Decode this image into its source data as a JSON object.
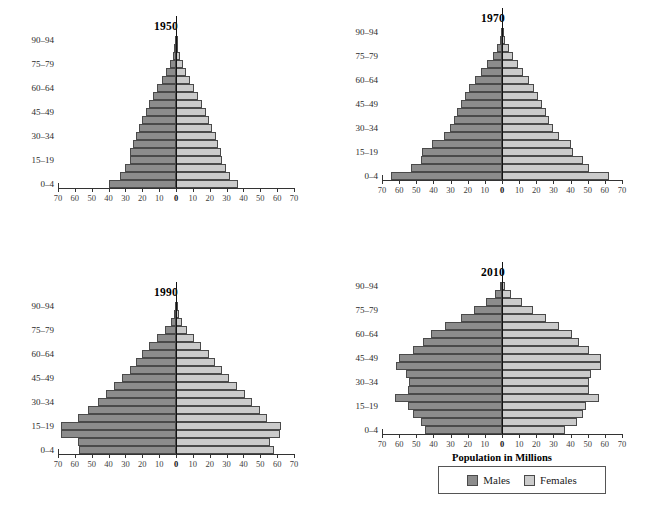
{
  "figure": {
    "axis_title": "Population in Millions",
    "legend": {
      "males_label": "Males",
      "females_label": "Females"
    },
    "colors": {
      "males": "#8c8c8c",
      "females": "#cbcbcb",
      "axis": "#333333"
    }
  },
  "chart_data": [
    {
      "type": "bar",
      "title": "1950",
      "xlabel": "Population in Millions",
      "ylabel": "",
      "xlim": [
        -70,
        70
      ],
      "xticks": [
        70,
        60,
        50,
        40,
        30,
        20,
        10,
        0,
        10,
        20,
        30,
        40,
        50,
        60,
        70
      ],
      "grid": false,
      "legend_position": "below-2010",
      "categories": [
        "0–4",
        "5–9",
        "10–14",
        "15–19",
        "20–24",
        "25–29",
        "30–34",
        "35–39",
        "40–44",
        "45–49",
        "50–54",
        "55–59",
        "60–64",
        "65–69",
        "70–74",
        "75–79",
        "80–84",
        "85–89",
        "90–94"
      ],
      "tick_categories": [
        "0–4",
        "15–19",
        "30–34",
        "45–49",
        "60–64",
        "75–79",
        "90–94"
      ],
      "series": [
        {
          "name": "Males",
          "values": [
            39.5,
            33.0,
            30.5,
            27.5,
            27.5,
            25.5,
            23.5,
            22.0,
            20.0,
            18.0,
            16.0,
            13.5,
            11.0,
            8.5,
            6.0,
            3.8,
            2.0,
            0.9,
            0.3
          ]
        },
        {
          "name": "Females",
          "values": [
            36.5,
            32.0,
            29.5,
            27.0,
            26.5,
            25.0,
            23.5,
            21.5,
            19.5,
            17.5,
            15.5,
            13.0,
            10.5,
            8.5,
            6.0,
            4.0,
            2.2,
            1.0,
            0.3
          ]
        }
      ]
    },
    {
      "type": "bar",
      "title": "1970",
      "xlabel": "Population in Millions",
      "ylabel": "",
      "xlim": [
        -70,
        70
      ],
      "xticks": [
        70,
        60,
        50,
        40,
        30,
        20,
        10,
        0,
        10,
        20,
        30,
        40,
        50,
        60,
        70
      ],
      "grid": false,
      "legend_position": "below-2010",
      "categories": [
        "0–4",
        "5–9",
        "10–14",
        "15–19",
        "20–24",
        "25–29",
        "30–34",
        "35–39",
        "40–44",
        "45–49",
        "50–54",
        "55–59",
        "60–64",
        "65–69",
        "70–74",
        "75–79",
        "80–84",
        "85–89",
        "90–94"
      ],
      "tick_categories": [
        "0–4",
        "15–19",
        "30–34",
        "45–49",
        "60–64",
        "75–79",
        "90–94"
      ],
      "series": [
        {
          "name": "Males",
          "values": [
            65.0,
            53.0,
            47.0,
            46.5,
            41.0,
            34.0,
            30.5,
            28.0,
            26.0,
            24.0,
            21.5,
            19.0,
            16.0,
            12.5,
            9.0,
            5.5,
            3.0,
            1.3,
            0.4
          ]
        },
        {
          "name": "Females",
          "values": [
            62.5,
            50.5,
            47.0,
            41.5,
            40.0,
            33.5,
            30.0,
            27.5,
            25.5,
            23.5,
            21.0,
            18.5,
            15.5,
            12.0,
            9.5,
            6.5,
            3.8,
            1.7,
            0.6
          ]
        }
      ]
    },
    {
      "type": "bar",
      "title": "1990",
      "xlabel": "Population in Millions",
      "ylabel": "",
      "xlim": [
        -70,
        70
      ],
      "xticks": [
        70,
        60,
        50,
        40,
        30,
        20,
        10,
        0,
        10,
        20,
        30,
        40,
        50,
        60,
        70
      ],
      "grid": false,
      "legend_position": "below-2010",
      "categories": [
        "0–4",
        "5–9",
        "10–14",
        "15–19",
        "20–24",
        "25–29",
        "30–34",
        "35–39",
        "40–44",
        "45–49",
        "50–54",
        "55–59",
        "60–64",
        "65–69",
        "70–74",
        "75–79",
        "80–84",
        "85–89",
        "90–94"
      ],
      "tick_categories": [
        "0–4",
        "15–19",
        "30–34",
        "45–49",
        "60–64",
        "75–79",
        "90–94"
      ],
      "series": [
        {
          "name": "Males",
          "values": [
            57.5,
            58.0,
            68.5,
            68.0,
            58.0,
            52.0,
            46.5,
            41.5,
            36.5,
            32.0,
            27.5,
            24.0,
            20.0,
            16.0,
            11.0,
            6.5,
            3.2,
            1.4,
            0.4
          ]
        },
        {
          "name": "Females",
          "values": [
            58.0,
            56.0,
            61.5,
            62.0,
            54.0,
            50.0,
            45.0,
            41.0,
            36.0,
            31.5,
            27.0,
            23.0,
            19.5,
            15.0,
            10.5,
            6.5,
            3.5,
            1.6,
            0.5
          ]
        }
      ]
    },
    {
      "type": "bar",
      "title": "2010",
      "xlabel": "Population in Millions",
      "ylabel": "",
      "xlim": [
        -70,
        70
      ],
      "xticks": [
        70,
        60,
        50,
        40,
        30,
        20,
        10,
        0,
        10,
        20,
        30,
        40,
        50,
        60,
        70
      ],
      "grid": false,
      "legend_position": "below-2010",
      "categories": [
        "0–4",
        "5–9",
        "10–14",
        "15–19",
        "20–24",
        "25–29",
        "30–34",
        "35–39",
        "40–44",
        "45–49",
        "50–54",
        "55–59",
        "60–64",
        "65–69",
        "70–74",
        "75–79",
        "80–84",
        "85–89",
        "90–94"
      ],
      "tick_categories": [
        "0–4",
        "15–19",
        "30–34",
        "45–49",
        "60–64",
        "75–79",
        "90–94"
      ],
      "series": [
        {
          "name": "Males",
          "values": [
            45.0,
            47.5,
            52.0,
            55.0,
            62.5,
            55.0,
            54.0,
            56.0,
            62.0,
            60.0,
            52.0,
            46.0,
            41.5,
            33.0,
            24.0,
            16.5,
            9.5,
            4.0,
            1.2
          ]
        },
        {
          "name": "Females",
          "values": [
            37.0,
            43.5,
            47.5,
            49.0,
            56.5,
            51.0,
            50.5,
            52.0,
            57.5,
            58.0,
            50.5,
            45.0,
            41.0,
            33.5,
            25.5,
            18.0,
            11.5,
            5.5,
            2.0
          ]
        }
      ]
    }
  ]
}
